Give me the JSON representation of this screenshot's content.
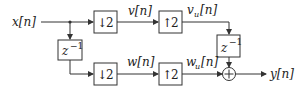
{
  "diagram": {
    "input_label": "x[n]",
    "output_label": "y[n]",
    "blocks": {
      "delay_in": {
        "base": "z",
        "exp": "−1"
      },
      "down_top": {
        "arrow": "↓",
        "factor": "2"
      },
      "down_bottom": {
        "arrow": "↓",
        "factor": "2"
      },
      "up_top": {
        "arrow": "↑",
        "factor": "2"
      },
      "up_bottom": {
        "arrow": "↑",
        "factor": "2"
      },
      "delay_out": {
        "base": "z",
        "exp": "−1"
      },
      "adder": {
        "symbol": "+"
      }
    },
    "signals": {
      "v": "v[n]",
      "w": "w[n]",
      "vu_base": "v",
      "vu_sub": "u",
      "vu_idx": "[n]",
      "wu_base": "w",
      "wu_sub": "u",
      "wu_idx": "[n]"
    }
  }
}
